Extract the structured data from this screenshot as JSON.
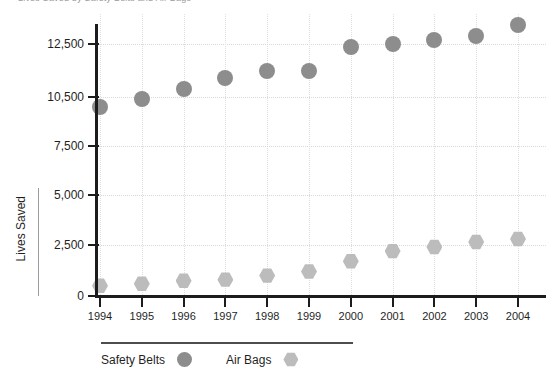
{
  "clipped_title": "Lives Saved by Safety Belts and Air Bags",
  "chart_data": {
    "type": "scatter",
    "title": "",
    "xlabel": "",
    "ylabel": "Lives Saved",
    "grid": true,
    "legend_position": "bottom-left",
    "categories": [
      "1994",
      "1995",
      "1996",
      "1997",
      "1998",
      "1999",
      "2000",
      "2001",
      "2002",
      "2003",
      "2004"
    ],
    "x": [
      1994,
      1995,
      1996,
      1997,
      1998,
      1999,
      2000,
      2001,
      2002,
      2003,
      2004
    ],
    "ylim": [
      0,
      13600
    ],
    "ytick_values": [
      0,
      2500,
      5000,
      7500,
      10500,
      12500
    ],
    "ytick_labels": [
      "0",
      "2,500",
      "5,000",
      "7,500",
      "10,500",
      "12,500"
    ],
    "series": [
      {
        "name": "Safety Belts",
        "marker": "circle",
        "color": "#8d8d8d",
        "values": [
          9900,
          10400,
          10800,
          11200,
          11500,
          11500,
          12400,
          12500,
          12650,
          12800,
          13200
        ]
      },
      {
        "name": "Air Bags",
        "marker": "hexagon",
        "color": "#bcbcbc",
        "values": [
          500,
          600,
          750,
          800,
          1000,
          1200,
          1700,
          2200,
          2400,
          2650,
          2800
        ]
      }
    ]
  },
  "colors": {
    "axis": "#1c1c1c",
    "grid": "#d9d9d9",
    "text": "#1f1f1f",
    "safety_belts": "#8d8d8d",
    "air_bags": "#bcbcbc"
  }
}
